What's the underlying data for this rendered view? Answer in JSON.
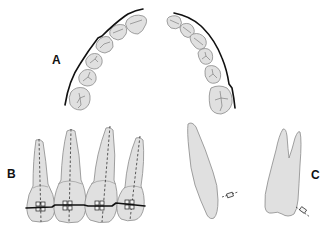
{
  "figure": {
    "panels": [
      {
        "id": "A",
        "label": "A",
        "description": "Occlusal view of dental arch with archwire"
      },
      {
        "id": "B",
        "label": "B",
        "description": "Frontal view of four teeth with brackets and archwire"
      },
      {
        "id": "C",
        "label": "C",
        "description": "Lateral profiles of two teeth with brackets"
      }
    ]
  },
  "colors": {
    "tooth_fill": "#e0e0e0",
    "tooth_outline": "#8a8a8a",
    "wire": "#111111",
    "background": "#ffffff"
  }
}
